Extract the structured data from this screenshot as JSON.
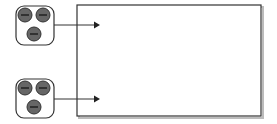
{
  "diagram": {
    "colors": {
      "stroke": "#333333",
      "circle_fill": "#666666",
      "minus": "#222222",
      "shadow": "#b0b0b0",
      "background": "#ffffff"
    },
    "sources": [
      {
        "name": "top",
        "box": {
          "x": 16,
          "y": 6,
          "w": 38,
          "h": 39
        },
        "circles": [
          {
            "cx": 25,
            "cy": 15
          },
          {
            "cx": 43,
            "cy": 15
          },
          {
            "cx": 34,
            "cy": 34
          }
        ],
        "arrow_y": 25
      },
      {
        "name": "bottom",
        "box": {
          "x": 16,
          "y": 79,
          "w": 38,
          "h": 39
        },
        "circles": [
          {
            "cx": 25,
            "cy": 88
          },
          {
            "cx": 43,
            "cy": 88
          },
          {
            "cx": 34,
            "cy": 107
          }
        ],
        "arrow_y": 99
      }
    ],
    "target_rect": {
      "x": 77,
      "y": 5,
      "w": 184,
      "h": 111
    }
  }
}
